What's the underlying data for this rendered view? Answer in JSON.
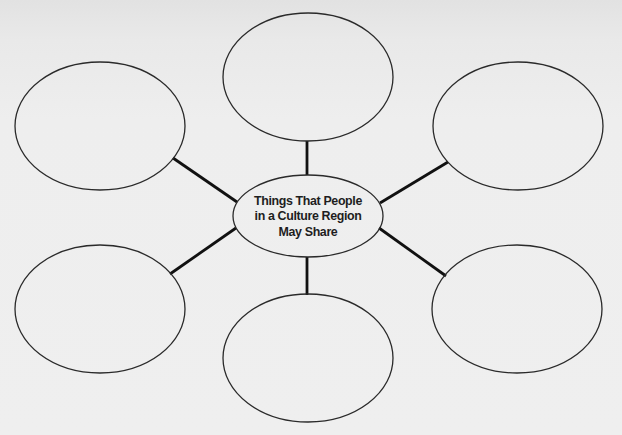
{
  "diagram": {
    "type": "web-organizer",
    "center": {
      "lines": [
        "Things That People",
        "in a Culture Region",
        "May Share"
      ],
      "cx": 308,
      "cy": 216,
      "rx": 75,
      "ry": 41
    },
    "nodes": [
      {
        "id": "top-left",
        "label": "",
        "cx": 100,
        "cy": 126,
        "rx": 85,
        "ry": 64
      },
      {
        "id": "top-center",
        "label": "",
        "cx": 308,
        "cy": 77,
        "rx": 85,
        "ry": 64
      },
      {
        "id": "top-right",
        "label": "",
        "cx": 518,
        "cy": 126,
        "rx": 85,
        "ry": 64
      },
      {
        "id": "bottom-left",
        "label": "",
        "cx": 100,
        "cy": 309,
        "rx": 85,
        "ry": 64
      },
      {
        "id": "bottom-center",
        "label": "",
        "cx": 308,
        "cy": 358,
        "rx": 85,
        "ry": 64
      },
      {
        "id": "bottom-right",
        "label": "",
        "cx": 517,
        "cy": 309,
        "rx": 85,
        "ry": 64
      }
    ],
    "connectors": [
      {
        "to": "top-left",
        "x1": 237,
        "y1": 202,
        "x2": 173,
        "y2": 158
      },
      {
        "to": "top-center",
        "x1": 307,
        "y1": 175,
        "x2": 307,
        "y2": 141
      },
      {
        "to": "top-right",
        "x1": 380,
        "y1": 203,
        "x2": 448,
        "y2": 162
      },
      {
        "to": "bottom-left",
        "x1": 236,
        "y1": 228,
        "x2": 170,
        "y2": 274
      },
      {
        "to": "bottom-center",
        "x1": 307,
        "y1": 257,
        "x2": 307,
        "y2": 295
      },
      {
        "to": "bottom-right",
        "x1": 379,
        "y1": 228,
        "x2": 446,
        "y2": 276
      }
    ],
    "colors": {
      "outline": "#2a2a2a",
      "connector": "#111111",
      "background": "#ededed"
    }
  }
}
